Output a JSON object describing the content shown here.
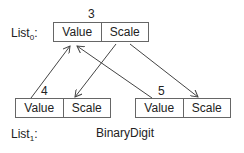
{
  "list0": {
    "label": "List",
    "subscript": "0",
    "suffix": ":"
  },
  "list1": {
    "label": "List",
    "subscript": "1",
    "suffix": ":",
    "type_label": "BinaryDigit"
  },
  "nodes": [
    {
      "index": "3",
      "fields": [
        "Value",
        "Scale"
      ]
    },
    {
      "index": "4",
      "fields": [
        "Value",
        "Scale"
      ]
    },
    {
      "index": "5",
      "fields": [
        "Value",
        "Scale"
      ]
    }
  ]
}
